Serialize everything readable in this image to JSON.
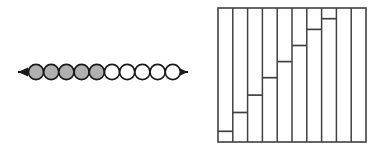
{
  "page": {
    "width": 380,
    "height": 152,
    "background": "#ffffff"
  },
  "colors": {
    "stroke": "#1a1a1a",
    "shaded_fill": "#b0b0b0",
    "unshaded_fill": "#ffffff",
    "background": "#ffffff"
  },
  "number_line": {
    "name": "bead-number-line",
    "axis": {
      "x_start": 18,
      "x_end": 188,
      "y": 72,
      "stroke_width": 2.2,
      "left_arrowhead": true,
      "right_arrowhead": true
    },
    "bead_count": 10,
    "shaded_count": 5,
    "unshaded_count": 5,
    "bead_radius": 7.6,
    "first_bead_cx": 36,
    "bead_spacing": 15.2,
    "beads": [
      {
        "index": 1,
        "state": "shaded"
      },
      {
        "index": 2,
        "state": "shaded"
      },
      {
        "index": 3,
        "state": "shaded"
      },
      {
        "index": 4,
        "state": "shaded"
      },
      {
        "index": 5,
        "state": "shaded"
      },
      {
        "index": 6,
        "state": "unshaded"
      },
      {
        "index": 7,
        "state": "unshaded"
      },
      {
        "index": 8,
        "state": "unshaded"
      },
      {
        "index": 9,
        "state": "unshaded"
      },
      {
        "index": 10,
        "state": "unshaded"
      }
    ]
  },
  "chart_data": {
    "type": "bar",
    "name": "staircase-column-chart",
    "title": "",
    "xlabel": "",
    "ylabel": "",
    "grid": false,
    "legend": false,
    "frame": {
      "x": 218,
      "y": 8,
      "width": 148,
      "height": 134,
      "stroke_width": 1.6,
      "border": true
    },
    "categories": [
      "1",
      "2",
      "3",
      "4",
      "5",
      "6",
      "7",
      "8",
      "9",
      "10"
    ],
    "values": [
      8,
      22,
      35,
      48,
      60,
      72,
      84,
      92,
      100,
      100
    ],
    "ylim": [
      0,
      100
    ],
    "column_count": 10,
    "divider_count": 9
  }
}
